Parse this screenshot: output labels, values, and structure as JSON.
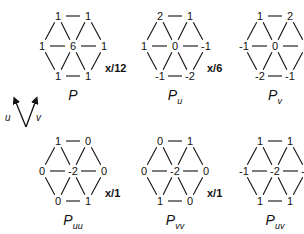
{
  "stencils": [
    {
      "name": "P",
      "sub": "",
      "scale": "x/12",
      "top": [
        "1",
        "1"
      ],
      "mid": [
        "1",
        "6",
        "1"
      ],
      "bot": [
        "1",
        "1"
      ]
    },
    {
      "name": "P",
      "sub": "u",
      "scale": "x/6",
      "top": [
        "2",
        "1"
      ],
      "mid": [
        "1",
        "0",
        "-1"
      ],
      "bot": [
        "-1",
        "-2"
      ]
    },
    {
      "name": "P",
      "sub": "v",
      "scale": "x/6",
      "top": [
        "1",
        "2"
      ],
      "mid": [
        "-1",
        "0",
        "1"
      ],
      "bot": [
        "-2",
        "-1"
      ]
    },
    {
      "name": "P",
      "sub": "uu",
      "scale": "x/1",
      "top": [
        "1",
        "0"
      ],
      "mid": [
        "0",
        "-2",
        "0"
      ],
      "bot": [
        "0",
        "1"
      ]
    },
    {
      "name": "P",
      "sub": "vv",
      "scale": "x/1",
      "top": [
        "0",
        "1"
      ],
      "mid": [
        "0",
        "-2",
        "0"
      ],
      "bot": [
        "1",
        "0"
      ]
    },
    {
      "name": "P",
      "sub": "uv",
      "scale": "x/2",
      "top": [
        "1",
        "1"
      ],
      "mid": [
        "-1",
        "-2",
        "-1"
      ],
      "bot": [
        "1",
        "1"
      ]
    }
  ],
  "axis": {
    "u_label": "u",
    "v_label": "v"
  }
}
